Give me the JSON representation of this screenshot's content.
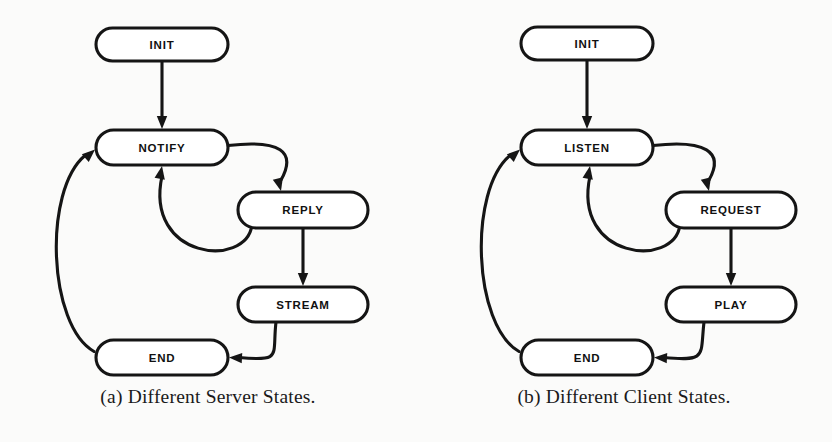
{
  "figure": {
    "background_color": "#fbfbfa",
    "stroke_color": "#151515",
    "node_fill_color": "#ffffff",
    "label_color": "#111111"
  },
  "subfigures": [
    {
      "key": "server",
      "caption": "(a) Different Server States.",
      "nodes": [
        {
          "id": "init",
          "label": "INIT",
          "x": 96,
          "y": 28,
          "w": 132,
          "h": 33
        },
        {
          "id": "notify",
          "label": "NOTIFY",
          "x": 96,
          "y": 130,
          "w": 132,
          "h": 35
        },
        {
          "id": "reply",
          "label": "REPLY",
          "x": 238,
          "y": 192,
          "w": 130,
          "h": 36
        },
        {
          "id": "stream",
          "label": "STREAM",
          "x": 238,
          "y": 287,
          "w": 130,
          "h": 35
        },
        {
          "id": "end",
          "label": "END",
          "x": 96,
          "y": 340,
          "w": 132,
          "h": 35
        }
      ],
      "edges": [
        {
          "from": "init",
          "to": "notify",
          "kind": "straight-down"
        },
        {
          "from": "notify",
          "to": "reply",
          "kind": "curve-right-down"
        },
        {
          "from": "reply",
          "to": "stream",
          "kind": "straight-down"
        },
        {
          "from": "stream",
          "to": "end",
          "kind": "curve-down-left"
        },
        {
          "from": "reply",
          "to": "notify",
          "kind": "curve-back-up-left"
        },
        {
          "from": "end",
          "to": "notify",
          "kind": "curve-far-left-up"
        }
      ]
    },
    {
      "key": "client",
      "caption": "(b) Different Client States.",
      "nodes": [
        {
          "id": "init",
          "label": "INIT",
          "x": 105,
          "y": 27,
          "w": 132,
          "h": 33
        },
        {
          "id": "listen",
          "label": "LISTEN",
          "x": 105,
          "y": 130,
          "w": 132,
          "h": 35
        },
        {
          "id": "request",
          "label": "REQUEST",
          "x": 250,
          "y": 192,
          "w": 130,
          "h": 36
        },
        {
          "id": "play",
          "label": "PLAY",
          "x": 250,
          "y": 287,
          "w": 130,
          "h": 35
        },
        {
          "id": "end",
          "label": "END",
          "x": 105,
          "y": 340,
          "w": 132,
          "h": 35
        }
      ],
      "edges": [
        {
          "from": "init",
          "to": "listen",
          "kind": "straight-down"
        },
        {
          "from": "listen",
          "to": "request",
          "kind": "curve-right-down"
        },
        {
          "from": "request",
          "to": "play",
          "kind": "straight-down"
        },
        {
          "from": "play",
          "to": "end",
          "kind": "curve-down-left"
        },
        {
          "from": "request",
          "to": "listen",
          "kind": "curve-back-up-left"
        },
        {
          "from": "end",
          "to": "listen",
          "kind": "curve-far-left-up"
        }
      ]
    }
  ]
}
